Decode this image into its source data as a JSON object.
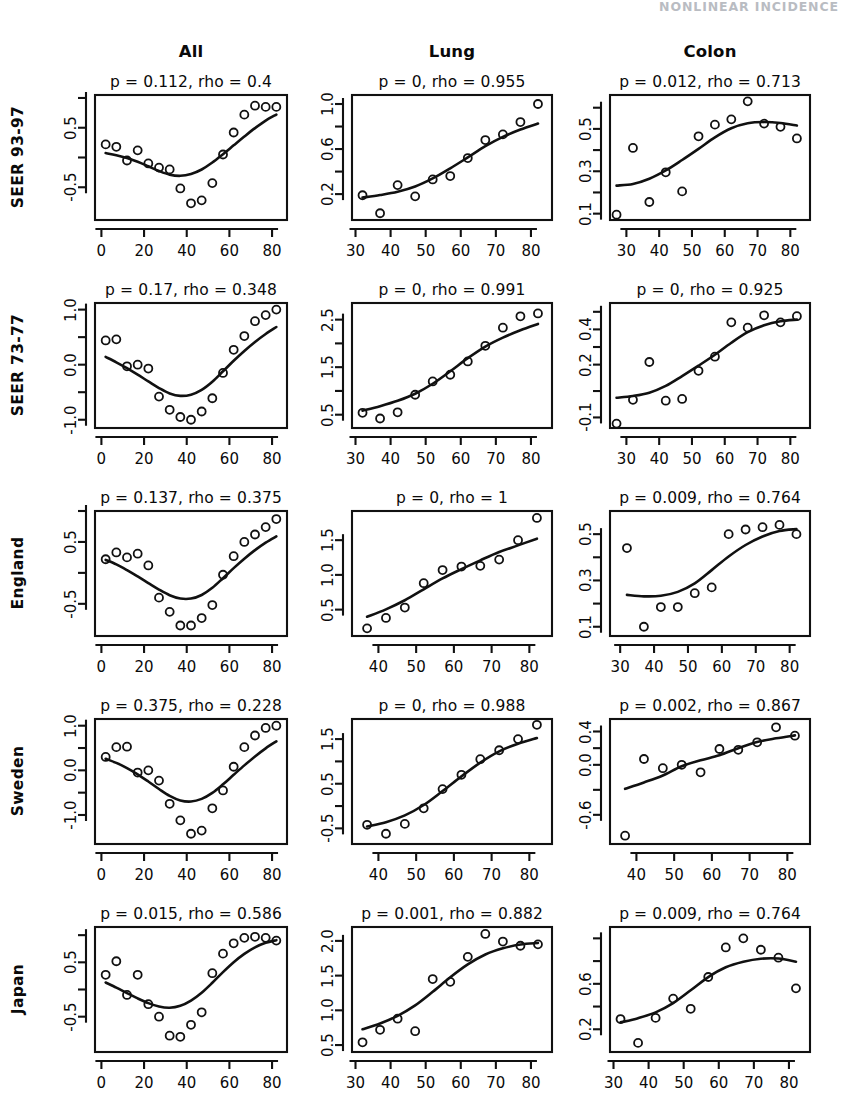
{
  "header": {
    "running_head": "NONLINEAR INCIDENCE"
  },
  "figure": {
    "column_titles": [
      "All",
      "Lung",
      "Colon"
    ],
    "row_labels": [
      "SEER 93-97",
      "SEER 73-77",
      "England",
      "Sweden",
      "Japan"
    ]
  },
  "chart_data": {
    "type": "scatter",
    "layout": {
      "rows": 5,
      "cols": 3,
      "grid": false,
      "legend": "none"
    },
    "xlabel": "",
    "ylabel": "",
    "panels": [
      {
        "row": "SEER 93-97",
        "col": "All",
        "title": "p = 0.112, rho = 0.4",
        "p": 0.112,
        "rho": 0.4,
        "xlim": [
          -3,
          87
        ],
        "ylim": [
          -1.05,
          1.05
        ],
        "xticks": [
          0,
          20,
          40,
          60,
          80
        ],
        "xtick_labels": [
          "0",
          "20",
          "40",
          "60",
          "80"
        ],
        "yticks": [
          -0.5,
          0.0,
          0.5,
          1.0
        ],
        "ytick_labels": [
          "-0.5",
          "",
          "0.5",
          ""
        ],
        "x": [
          2,
          7,
          12,
          17,
          22,
          27,
          32,
          37,
          42,
          47,
          52,
          57,
          62,
          67,
          72,
          77,
          82
        ],
        "y": [
          0.22,
          0.18,
          -0.05,
          0.12,
          -0.1,
          -0.17,
          -0.2,
          -0.52,
          -0.77,
          -0.72,
          -0.43,
          0.05,
          0.42,
          0.72,
          0.87,
          0.85,
          0.85
        ]
      },
      {
        "row": "SEER 93-97",
        "col": "Lung",
        "title": "p = 0, rho = 0.955",
        "p": 0,
        "rho": 0.955,
        "xlim": [
          29,
          86
        ],
        "ylim": [
          -0.03,
          1.08
        ],
        "xticks": [
          30,
          40,
          50,
          60,
          70,
          80
        ],
        "xtick_labels": [
          "30",
          "40",
          "50",
          "60",
          "70",
          "80"
        ],
        "yticks": [
          0.2,
          0.4,
          0.6,
          0.8,
          1.0
        ],
        "ytick_labels": [
          "0.2",
          "",
          "0.6",
          "",
          "1.0"
        ],
        "x": [
          32,
          37,
          42,
          47,
          52,
          57,
          62,
          67,
          72,
          77,
          82
        ],
        "y": [
          0.19,
          0.03,
          0.28,
          0.18,
          0.33,
          0.36,
          0.52,
          0.68,
          0.73,
          0.84,
          1.0
        ]
      },
      {
        "row": "SEER 93-97",
        "col": "Colon",
        "title": "p = 0.012, rho = 0.713",
        "p": 0.012,
        "rho": 0.713,
        "xlim": [
          25,
          86
        ],
        "ylim": [
          0.07,
          0.66
        ],
        "xticks": [
          30,
          40,
          50,
          60,
          70,
          80
        ],
        "xtick_labels": [
          "30",
          "40",
          "50",
          "60",
          "70",
          "80"
        ],
        "yticks": [
          0.1,
          0.2,
          0.3,
          0.4,
          0.5,
          0.6
        ],
        "ytick_labels": [
          "0.1",
          "",
          "0.3",
          "",
          "0.5",
          ""
        ],
        "x": [
          27,
          32,
          37,
          42,
          47,
          52,
          57,
          62,
          67,
          72,
          77,
          82
        ],
        "y": [
          0.095,
          0.41,
          0.155,
          0.295,
          0.205,
          0.465,
          0.52,
          0.545,
          0.63,
          0.525,
          0.51,
          0.455
        ]
      },
      {
        "row": "SEER 73-77",
        "col": "All",
        "title": "p = 0.17, rho = 0.348",
        "p": 0.17,
        "rho": 0.348,
        "xlim": [
          -3,
          87
        ],
        "ylim": [
          -1.15,
          1.12
        ],
        "xticks": [
          0,
          20,
          40,
          60,
          80
        ],
        "xtick_labels": [
          "0",
          "20",
          "40",
          "60",
          "80"
        ],
        "yticks": [
          -1.0,
          -0.5,
          0.0,
          0.5,
          1.0
        ],
        "ytick_labels": [
          "-1.0",
          "",
          "0.0",
          "",
          "1.0"
        ],
        "x": [
          2,
          7,
          12,
          17,
          22,
          27,
          32,
          37,
          42,
          47,
          52,
          57,
          62,
          67,
          72,
          77,
          82
        ],
        "y": [
          0.44,
          0.46,
          -0.03,
          0.0,
          -0.07,
          -0.58,
          -0.82,
          -0.95,
          -1.0,
          -0.85,
          -0.61,
          -0.15,
          0.27,
          0.52,
          0.79,
          0.9,
          1.0
        ]
      },
      {
        "row": "SEER 73-77",
        "col": "Lung",
        "title": "p = 0, rho = 0.991",
        "p": 0,
        "rho": 0.991,
        "xlim": [
          29,
          86
        ],
        "ylim": [
          0.22,
          2.85
        ],
        "xticks": [
          30,
          40,
          50,
          60,
          70,
          80
        ],
        "xtick_labels": [
          "30",
          "40",
          "50",
          "60",
          "70",
          "80"
        ],
        "yticks": [
          0.5,
          1.0,
          1.5,
          2.0,
          2.5
        ],
        "ytick_labels": [
          "0.5",
          "",
          "1.5",
          "",
          "2.5"
        ],
        "x": [
          32,
          37,
          42,
          47,
          52,
          57,
          62,
          67,
          72,
          77,
          82
        ],
        "y": [
          0.54,
          0.42,
          0.55,
          0.92,
          1.2,
          1.34,
          1.62,
          1.95,
          2.33,
          2.57,
          2.63
        ]
      },
      {
        "row": "SEER 73-77",
        "col": "Colon",
        "title": "p = 0, rho = 0.925",
        "p": 0,
        "rho": 0.925,
        "xlim": [
          25,
          86
        ],
        "ylim": [
          -0.16,
          0.55
        ],
        "xticks": [
          30,
          40,
          50,
          60,
          70,
          80
        ],
        "xtick_labels": [
          "30",
          "40",
          "50",
          "60",
          "70",
          "80"
        ],
        "yticks": [
          -0.1,
          0.05,
          0.2,
          0.3,
          0.4,
          0.5
        ],
        "ytick_labels": [
          "-0.1",
          "",
          "0.2",
          "",
          "0.4",
          ""
        ],
        "x": [
          27,
          32,
          37,
          42,
          47,
          52,
          57,
          62,
          67,
          72,
          77,
          82
        ],
        "y": [
          -0.135,
          0.0,
          0.215,
          -0.005,
          0.005,
          0.165,
          0.245,
          0.44,
          0.41,
          0.48,
          0.44,
          0.475
        ]
      },
      {
        "row": "England",
        "col": "All",
        "title": "p = 0.137, rho = 0.375",
        "p": 0.137,
        "rho": 0.375,
        "xlim": [
          -3,
          87
        ],
        "ylim": [
          -1.02,
          1.0
        ],
        "xticks": [
          0,
          20,
          40,
          60,
          80
        ],
        "xtick_labels": [
          "0",
          "20",
          "40",
          "60",
          "80"
        ],
        "yticks": [
          -0.5,
          0.0,
          0.5,
          1.0
        ],
        "ytick_labels": [
          "-0.5",
          "",
          "0.5",
          ""
        ],
        "x": [
          2,
          7,
          12,
          17,
          22,
          27,
          32,
          37,
          42,
          47,
          52,
          57,
          62,
          67,
          72,
          77,
          82
        ],
        "y": [
          0.22,
          0.33,
          0.25,
          0.31,
          0.12,
          -0.4,
          -0.63,
          -0.85,
          -0.85,
          -0.73,
          -0.52,
          -0.03,
          0.27,
          0.5,
          0.62,
          0.74,
          0.87
        ]
      },
      {
        "row": "England",
        "col": "Lung",
        "title": "p = 0, rho = 1",
        "p": 0,
        "rho": 1,
        "xlim": [
          33,
          86
        ],
        "ylim": [
          0.12,
          1.92
        ],
        "xticks": [
          40,
          50,
          60,
          70,
          80
        ],
        "xtick_labels": [
          "40",
          "50",
          "60",
          "70",
          "80"
        ],
        "yticks": [
          0.5,
          1.0,
          1.5
        ],
        "ytick_labels": [
          "0.5",
          "1.0",
          "1.5"
        ],
        "x": [
          37,
          42,
          47,
          52,
          57,
          62,
          67,
          72,
          77,
          82
        ],
        "y": [
          0.23,
          0.38,
          0.53,
          0.88,
          1.07,
          1.12,
          1.13,
          1.22,
          1.5,
          1.82
        ]
      },
      {
        "row": "England",
        "col": "Colon",
        "title": "p = 0.009, rho = 0.764",
        "p": 0.009,
        "rho": 0.764,
        "xlim": [
          27,
          86
        ],
        "ylim": [
          0.06,
          0.6
        ],
        "xticks": [
          30,
          40,
          50,
          60,
          70,
          80
        ],
        "xtick_labels": [
          "30",
          "40",
          "50",
          "60",
          "70",
          "80"
        ],
        "yticks": [
          0.1,
          0.2,
          0.3,
          0.4,
          0.5
        ],
        "ytick_labels": [
          "0.1",
          "",
          "0.3",
          "",
          "0.5"
        ],
        "x": [
          32,
          37,
          42,
          47,
          52,
          57,
          62,
          67,
          72,
          77,
          82
        ],
        "y": [
          0.44,
          0.1,
          0.185,
          0.185,
          0.245,
          0.27,
          0.5,
          0.52,
          0.53,
          0.54,
          0.5
        ]
      },
      {
        "row": "Sweden",
        "col": "All",
        "title": "p = 0.375, rho = 0.228",
        "p": 0.375,
        "rho": 0.228,
        "xlim": [
          -3,
          87
        ],
        "ylim": [
          -1.65,
          1.15
        ],
        "xticks": [
          0,
          20,
          40,
          60,
          80
        ],
        "xtick_labels": [
          "0",
          "20",
          "40",
          "60",
          "80"
        ],
        "yticks": [
          -1.0,
          -0.5,
          0.0,
          0.5,
          1.0
        ],
        "ytick_labels": [
          "-1.0",
          "",
          "0.0",
          "",
          "1.0"
        ],
        "x": [
          2,
          7,
          12,
          17,
          22,
          27,
          32,
          37,
          42,
          47,
          52,
          57,
          62,
          67,
          72,
          77,
          82
        ],
        "y": [
          0.3,
          0.52,
          0.53,
          -0.05,
          0.0,
          -0.23,
          -0.75,
          -1.12,
          -1.42,
          -1.35,
          -0.85,
          -0.45,
          0.08,
          0.52,
          0.78,
          0.95,
          1.0
        ]
      },
      {
        "row": "Sweden",
        "col": "Lung",
        "title": "p = 0, rho = 0.988",
        "p": 0,
        "rho": 0.988,
        "xlim": [
          33,
          86
        ],
        "ylim": [
          -0.85,
          1.95
        ],
        "xticks": [
          40,
          50,
          60,
          70,
          80
        ],
        "xtick_labels": [
          "40",
          "50",
          "60",
          "70",
          "80"
        ],
        "yticks": [
          -0.5,
          0.0,
          0.5,
          1.0,
          1.5
        ],
        "ytick_labels": [
          "-0.5",
          "",
          "0.5",
          "",
          "1.5"
        ],
        "x": [
          37,
          42,
          47,
          52,
          57,
          62,
          67,
          72,
          77,
          82
        ],
        "y": [
          -0.42,
          -0.62,
          -0.4,
          -0.05,
          0.38,
          0.7,
          1.05,
          1.25,
          1.5,
          1.82
        ]
      },
      {
        "row": "Sweden",
        "col": "Colon",
        "title": "p = 0.002, rho = 0.867",
        "p": 0.002,
        "rho": 0.867,
        "xlim": [
          33,
          86
        ],
        "ylim": [
          -0.95,
          0.55
        ],
        "xticks": [
          40,
          50,
          60,
          70,
          80
        ],
        "xtick_labels": [
          "40",
          "50",
          "60",
          "70",
          "80"
        ],
        "yticks": [
          -0.6,
          -0.3,
          0.0,
          0.2,
          0.4
        ],
        "ytick_labels": [
          "-0.6",
          "",
          "0.0",
          "",
          "0.4"
        ],
        "x": [
          37,
          42,
          47,
          52,
          57,
          62,
          67,
          72,
          77,
          82
        ],
        "y": [
          -0.85,
          0.07,
          -0.04,
          0.0,
          -0.09,
          0.19,
          0.18,
          0.27,
          0.45,
          0.35
        ]
      },
      {
        "row": "Japan",
        "col": "All",
        "title": "p = 0.015, rho = 0.586",
        "p": 0.015,
        "rho": 0.586,
        "xlim": [
          -3,
          87
        ],
        "ylim": [
          -1.15,
          1.15
        ],
        "xticks": [
          0,
          20,
          40,
          60,
          80
        ],
        "xtick_labels": [
          "0",
          "20",
          "40",
          "60",
          "80"
        ],
        "yticks": [
          -0.5,
          0.0,
          0.5,
          1.0
        ],
        "ytick_labels": [
          "-0.5",
          "",
          "0.5",
          ""
        ],
        "x": [
          2,
          7,
          12,
          17,
          22,
          27,
          32,
          37,
          42,
          47,
          52,
          57,
          62,
          67,
          72,
          77,
          82
        ],
        "y": [
          0.27,
          0.52,
          -0.1,
          0.27,
          -0.27,
          -0.5,
          -0.85,
          -0.87,
          -0.65,
          -0.42,
          0.3,
          0.66,
          0.85,
          0.95,
          0.97,
          0.95,
          0.9
        ]
      },
      {
        "row": "Japan",
        "col": "Lung",
        "title": "p = 0.001, rho = 0.882",
        "p": 0.001,
        "rho": 0.882,
        "xlim": [
          29,
          86
        ],
        "ylim": [
          0.4,
          2.2
        ],
        "xticks": [
          30,
          40,
          50,
          60,
          70,
          80
        ],
        "xtick_labels": [
          "30",
          "40",
          "50",
          "60",
          "70",
          "80"
        ],
        "yticks": [
          0.5,
          1.0,
          1.5,
          2.0
        ],
        "ytick_labels": [
          "0.5",
          "1.0",
          "1.5",
          "2.0"
        ],
        "x": [
          32,
          37,
          42,
          47,
          52,
          57,
          62,
          67,
          72,
          77,
          82
        ],
        "y": [
          0.54,
          0.72,
          0.88,
          0.7,
          1.45,
          1.41,
          1.77,
          2.1,
          1.99,
          1.93,
          1.95
        ]
      },
      {
        "row": "Japan",
        "col": "Colon",
        "title": "p = 0.009, rho = 0.764",
        "p": 0.009,
        "rho": 0.764,
        "xlim": [
          29,
          86
        ],
        "ylim": [
          0.0,
          1.1
        ],
        "xticks": [
          30,
          40,
          50,
          60,
          70,
          80
        ],
        "xtick_labels": [
          "30",
          "40",
          "50",
          "60",
          "70",
          "80"
        ],
        "yticks": [
          0.2,
          0.4,
          0.6,
          0.8,
          1.0
        ],
        "ytick_labels": [
          "0.2",
          "",
          "0.6",
          "",
          ""
        ],
        "x": [
          32,
          37,
          42,
          47,
          52,
          57,
          62,
          67,
          72,
          77,
          82
        ],
        "y": [
          0.29,
          0.08,
          0.3,
          0.47,
          0.38,
          0.66,
          0.92,
          1.0,
          0.9,
          0.83,
          0.56
        ]
      }
    ]
  }
}
